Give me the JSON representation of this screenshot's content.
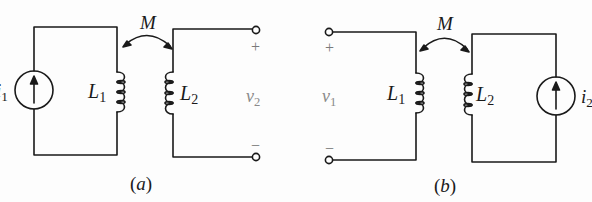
{
  "figure": {
    "panels": [
      {
        "id": "a",
        "caption_open": "(",
        "caption_letter": "a",
        "caption_close": ")",
        "mutual": "M",
        "source_label_base": "i",
        "source_label_sub": "1",
        "l1_base": "L",
        "l1_sub": "1",
        "l2_base": "L",
        "l2_sub": "2",
        "voltage_base": "v",
        "voltage_sub": "2",
        "plus": "+",
        "minus": "−"
      },
      {
        "id": "b",
        "caption_open": "(",
        "caption_letter": "b",
        "caption_close": ")",
        "mutual": "M",
        "source_label_base": "i",
        "source_label_sub": "2",
        "l1_base": "L",
        "l1_sub": "1",
        "l2_base": "L",
        "l2_sub": "2",
        "voltage_base": "v",
        "voltage_sub": "1",
        "plus": "+",
        "minus": "−"
      }
    ],
    "colors": {
      "wire": "#1a1a1a",
      "label": "#1a1a1a",
      "terminal_label": "#8a8a8a"
    }
  }
}
